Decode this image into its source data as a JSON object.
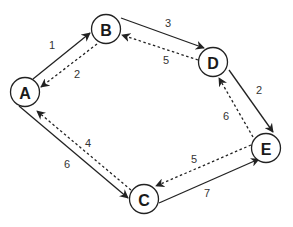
{
  "diagram": {
    "type": "directed-graph",
    "nodes": [
      {
        "id": "A",
        "label": "A",
        "x": 25,
        "y": 92
      },
      {
        "id": "B",
        "label": "B",
        "x": 106,
        "y": 29
      },
      {
        "id": "C",
        "label": "C",
        "x": 144,
        "y": 199
      },
      {
        "id": "D",
        "label": "D",
        "x": 213,
        "y": 62
      },
      {
        "id": "E",
        "label": "E",
        "x": 266,
        "y": 148
      }
    ],
    "edges": [
      {
        "from": "A",
        "to": "B",
        "label": "1",
        "style": "solid"
      },
      {
        "from": "B",
        "to": "A",
        "label": "2",
        "style": "dashed"
      },
      {
        "from": "B",
        "to": "D",
        "label": "3",
        "style": "solid"
      },
      {
        "from": "D",
        "to": "B",
        "label": "5",
        "style": "dashed"
      },
      {
        "from": "D",
        "to": "E",
        "label": "2",
        "style": "solid"
      },
      {
        "from": "E",
        "to": "D",
        "label": "6",
        "style": "dashed"
      },
      {
        "from": "C",
        "to": "E",
        "label": "7",
        "style": "solid"
      },
      {
        "from": "E",
        "to": "C",
        "label": "5",
        "style": "dashed"
      },
      {
        "from": "A",
        "to": "C",
        "label": "6",
        "style": "solid"
      },
      {
        "from": "C",
        "to": "A",
        "label": "4",
        "style": "dashed"
      }
    ],
    "edge_labels": {
      "ab": "1",
      "ba": "2",
      "bd": "3",
      "db": "5",
      "de": "2",
      "ed": "6",
      "ce": "7",
      "ec": "5",
      "ac": "6",
      "ca": "4"
    },
    "node_labels": {
      "a": "A",
      "b": "B",
      "c": "C",
      "d": "D",
      "e": "E"
    }
  }
}
